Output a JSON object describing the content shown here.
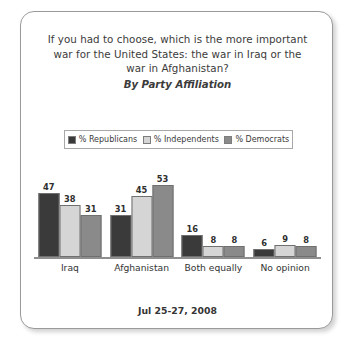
{
  "card": {
    "title_lines": [
      "If you had to choose, which is the more important",
      "war for the United States: the war in Iraq or the",
      "war in Afghanistan?"
    ],
    "subtitle": "By Party Affiliation",
    "footer": "Jul 25-27, 2008"
  },
  "legend": {
    "items": [
      {
        "label": "% Republicans",
        "color": "#3a3a3a"
      },
      {
        "label": "% Independents",
        "color": "#d5d5d5"
      },
      {
        "label": "% Democrats",
        "color": "#8a8a8a"
      }
    ]
  },
  "chart_data": {
    "type": "bar",
    "title": "If you had to choose, which is the more important war for the United States: the war in Iraq or the war in Afghanistan?",
    "subtitle": "By Party Affiliation",
    "xlabel": "",
    "ylabel": "",
    "ylim": [
      0,
      53
    ],
    "grid": false,
    "legend_position": "top",
    "categories": [
      "Iraq",
      "Afghanistan",
      "Both equally",
      "No opinion"
    ],
    "series": [
      {
        "name": "% Republicans",
        "color": "#3a3a3a",
        "values": [
          47,
          31,
          16,
          6
        ]
      },
      {
        "name": "% Independents",
        "color": "#d5d5d5",
        "values": [
          38,
          45,
          8,
          9
        ]
      },
      {
        "name": "% Democrats",
        "color": "#8a8a8a",
        "values": [
          31,
          53,
          8,
          8
        ]
      }
    ],
    "annotation": "Jul 25-27, 2008"
  }
}
